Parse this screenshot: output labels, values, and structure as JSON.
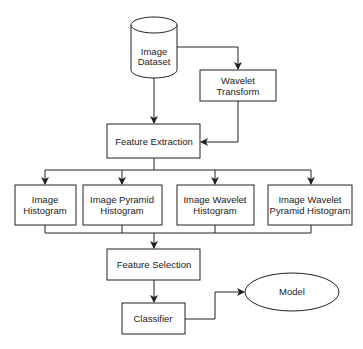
{
  "diagram": {
    "type": "flowchart",
    "nodes": {
      "dataset": {
        "shape": "cylinder",
        "line1": "Image",
        "line2": "Dataset"
      },
      "wavelet": {
        "shape": "rect",
        "line1": "Wavelet",
        "line2": "Transform"
      },
      "extraction": {
        "shape": "rect",
        "label": "Feature Extraction"
      },
      "hist1": {
        "shape": "rect",
        "line1": "Image",
        "line2": "Histogram"
      },
      "hist2": {
        "shape": "rect",
        "line1": "Image Pyramid",
        "line2": "Histogram"
      },
      "hist3": {
        "shape": "rect",
        "line1": "Image Wavelet",
        "line2": "Histogram"
      },
      "hist4": {
        "shape": "rect",
        "line1": "Image Wavelet",
        "line2": "Pyramid Histogram"
      },
      "selection": {
        "shape": "rect",
        "label": "Feature Selection"
      },
      "classifier": {
        "shape": "rect",
        "label": "Classifier"
      },
      "model": {
        "shape": "ellipse",
        "label": "Model"
      }
    },
    "edges": [
      {
        "from": "Image Dataset",
        "to": "Wavelet Transform"
      },
      {
        "from": "Image Dataset",
        "to": "Feature Extraction"
      },
      {
        "from": "Wavelet Transform",
        "to": "Feature Extraction"
      },
      {
        "from": "Feature Extraction",
        "to": "Image Histogram"
      },
      {
        "from": "Feature Extraction",
        "to": "Image Pyramid Histogram"
      },
      {
        "from": "Feature Extraction",
        "to": "Image Wavelet Histogram"
      },
      {
        "from": "Feature Extraction",
        "to": "Image Wavelet Pyramid Histogram"
      },
      {
        "from": "Image Histogram",
        "to": "Feature Selection"
      },
      {
        "from": "Image Pyramid Histogram",
        "to": "Feature Selection"
      },
      {
        "from": "Image Wavelet Histogram",
        "to": "Feature Selection"
      },
      {
        "from": "Image Wavelet Pyramid Histogram",
        "to": "Feature Selection"
      },
      {
        "from": "Feature Selection",
        "to": "Classifier"
      },
      {
        "from": "Classifier",
        "to": "Model"
      }
    ],
    "colors": {
      "stroke": "#222222",
      "fill": "#ffffff",
      "text": "#222222"
    }
  }
}
